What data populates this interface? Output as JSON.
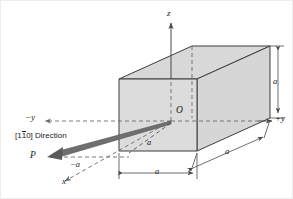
{
  "figure": {
    "kind": "crystallographic-unit-cell-direction-diagram",
    "background_color": "#ffffff",
    "cube_fill_color": "#d8d8d8",
    "cube_edge_color": "#3c3c3c",
    "axis_color": "#4a4a4a",
    "dashed_color": "#6b6b6b",
    "vector_color": "#555555",
    "text_color": "#1a1a1a"
  },
  "labels": {
    "axis_z": "z",
    "axis_x": "x",
    "axis_plus_y": "+y",
    "axis_minus_y": "−y",
    "origin": "O",
    "point_p": "P",
    "direction_prefix": "[1",
    "direction_overbar_digit": "1",
    "direction_suffix": "0] Direction",
    "direction_full": "[1̅1̅0] Direction",
    "dim_height_right": "a",
    "dim_width_bottom": "a",
    "dim_depth_diagonal": "a",
    "dim_interior_diagonal": "a",
    "dim_negative_a": "−a"
  },
  "geometry": {
    "origin_point": {
      "x": 170,
      "y": 120
    },
    "cube_front_face": {
      "x": 118,
      "y": 78,
      "w": 78,
      "h": 72
    },
    "cube_depth_offset": {
      "dx": 73,
      "dy": -33
    },
    "point_p": {
      "x": 47,
      "y": 156
    },
    "z_axis_top": {
      "x": 170,
      "y": 18
    },
    "plus_y_axis_end": {
      "x": 272,
      "y": 120
    },
    "minus_y_axis_end": {
      "x": 42,
      "y": 120
    },
    "x_axis_end": {
      "x": 62,
      "y": 182
    }
  }
}
